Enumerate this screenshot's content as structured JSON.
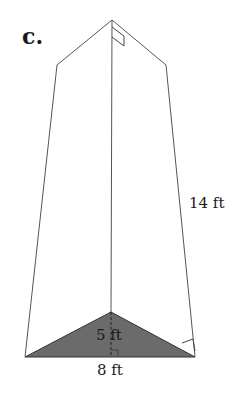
{
  "figure": {
    "part_label": "c.",
    "shape": "triangular prism",
    "labels": {
      "length": "14 ft",
      "triangle_height": "5 ft",
      "triangle_base": "8 ft"
    },
    "colors": {
      "edge": "#555555",
      "base_fill": "#6b6b6b",
      "text": "#1a1a1a"
    }
  }
}
